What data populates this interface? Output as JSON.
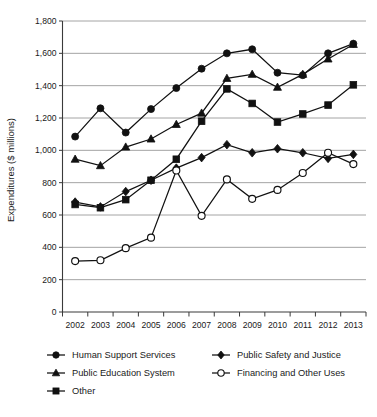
{
  "chart_data": {
    "type": "line",
    "title": "",
    "xlabel": "",
    "ylabel": "Expenditures ($ millions)",
    "ylim": [
      0,
      1800
    ],
    "ytick_labels": [
      "0",
      "200",
      "400",
      "600",
      "800",
      "1,000",
      "1,200",
      "1,400",
      "1,600",
      "1,800"
    ],
    "ytick_values": [
      0,
      200,
      400,
      600,
      800,
      1000,
      1200,
      1400,
      1600,
      1800
    ],
    "grid": true,
    "legend_position": "bottom",
    "categories": [
      "2002",
      "2003",
      "2004",
      "2005",
      "2006",
      "2007",
      "2008",
      "2009",
      "2010",
      "2011",
      "2012",
      "2013"
    ],
    "x": [
      2002,
      2003,
      2004,
      2005,
      2006,
      2007,
      2008,
      2009,
      2010,
      2011,
      2012,
      2013
    ],
    "series": [
      {
        "name": "Human Support Services",
        "marker": "filled-circle",
        "values": [
          1085,
          1260,
          1110,
          1255,
          1385,
          1505,
          1600,
          1625,
          1480,
          1465,
          1600,
          1660
        ]
      },
      {
        "name": "Public Education System",
        "marker": "filled-triangle",
        "values": [
          945,
          905,
          1020,
          1070,
          1160,
          1230,
          1445,
          1470,
          1390,
          1470,
          1565,
          1655
        ]
      },
      {
        "name": "Other",
        "marker": "filled-square",
        "values": [
          665,
          645,
          695,
          815,
          945,
          1180,
          1380,
          1290,
          1175,
          1225,
          1280,
          1405
        ]
      },
      {
        "name": "Public Safety and Justice",
        "marker": "filled-diamond",
        "values": [
          680,
          650,
          745,
          815,
          890,
          955,
          1035,
          985,
          1010,
          985,
          950,
          975
        ]
      },
      {
        "name": "Financing and Other Uses",
        "marker": "open-circle",
        "values": [
          315,
          320,
          395,
          460,
          875,
          595,
          820,
          700,
          755,
          860,
          985,
          915
        ]
      }
    ],
    "legend": [
      {
        "label": "Human Support Services",
        "marker": "filled-circle",
        "column": 0,
        "row": 0
      },
      {
        "label": "Public Safety and Justice",
        "marker": "filled-diamond",
        "column": 1,
        "row": 0
      },
      {
        "label": "Public Education System",
        "marker": "filled-triangle",
        "column": 0,
        "row": 1
      },
      {
        "label": "Financing and Other Uses",
        "marker": "open-circle",
        "column": 1,
        "row": 1
      },
      {
        "label": "Other",
        "marker": "filled-square",
        "column": 0,
        "row": 2
      }
    ],
    "colors": {
      "series": "#111111",
      "grid": "#9a9a9a",
      "axis": "#3a3a3a",
      "background": "#ffffff"
    }
  }
}
